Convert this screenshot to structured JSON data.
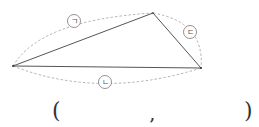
{
  "diagram": {
    "type": "triangle-with-labeled-sides",
    "vertices": {
      "left": [
        13,
        66
      ],
      "top": [
        153,
        13
      ],
      "right": [
        201,
        68
      ]
    },
    "side_labels": [
      {
        "id": "giyeok",
        "text": "ㄱ",
        "side": "left-top",
        "position": [
          74,
          21
        ]
      },
      {
        "id": "nieun",
        "text": "ㄴ",
        "side": "left-right",
        "position": [
          105,
          82
        ]
      },
      {
        "id": "digeut",
        "text": "ㄷ",
        "side": "top-right",
        "position": [
          190,
          32
        ]
      }
    ],
    "colors": {
      "edge": "#555555",
      "dashed_arc": "#aaaaaa",
      "label_circle": "#777777"
    }
  },
  "answer_blank": {
    "open_paren": "(",
    "separator": ",",
    "close_paren": ")"
  }
}
